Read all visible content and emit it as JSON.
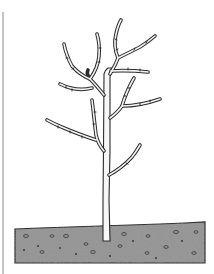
{
  "illustration": {
    "subject": "young bare tree planted in soil",
    "alt": "Line drawing of a young leafless tree with a straight trunk and several upward-curving branches, standing in a speckled gray soil bed",
    "colors": {
      "background": "#ffffff",
      "outline": "#2a2a2a",
      "trunk_fill": "#f7f7f7",
      "soil_fill": "#8f8f8f",
      "soil_speckle": "#4a4a4a",
      "frame_line": "#bdbdbd"
    }
  }
}
